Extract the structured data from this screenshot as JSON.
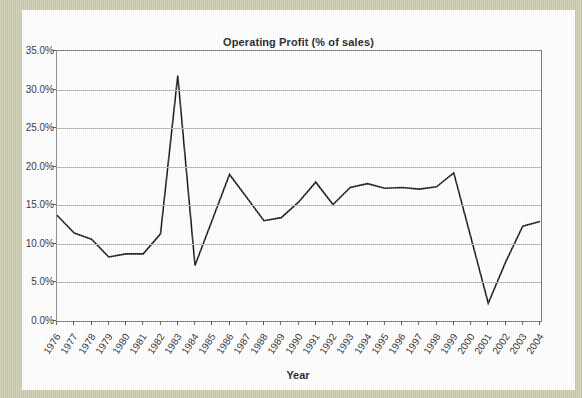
{
  "page": {
    "border_color": "#cbcbad",
    "paper_color": "#ffffff"
  },
  "chart": {
    "title": "Operating Profit (% of sales)",
    "x_axis_title": "Year",
    "line_color": "#1a1a1a",
    "grid_color": "#b4b4b4",
    "frame_color": "#7a7a7a"
  },
  "chart_data": {
    "type": "line",
    "title": "Operating Profit (% of sales)",
    "xlabel": "Year",
    "ylabel": "",
    "ylim": [
      0,
      35
    ],
    "ytick_values": [
      0,
      5,
      10,
      15,
      20,
      25,
      30,
      35
    ],
    "ytick_labels": [
      "0.0%",
      "5.0%",
      "10.0%",
      "15.0%",
      "20.0%",
      "25.0%",
      "30.0%",
      "35.0%"
    ],
    "grid": true,
    "legend": "none",
    "x": [
      1976,
      1977,
      1978,
      1979,
      1980,
      1981,
      1982,
      1983,
      1984,
      1985,
      1986,
      1987,
      1988,
      1989,
      1990,
      1991,
      1992,
      1993,
      1994,
      1995,
      1996,
      1997,
      1998,
      1999,
      2000,
      2001,
      2002,
      2003,
      2004
    ],
    "xtick_labels": [
      "1976",
      "1977",
      "1978",
      "1979",
      "1980",
      "1981",
      "1982",
      "1983",
      "1984",
      "1985",
      "1986",
      "1987",
      "1988",
      "1989",
      "1990",
      "1991",
      "1992",
      "1993",
      "1994",
      "1995",
      "1996",
      "1997",
      "1998",
      "1999",
      "2000",
      "2001",
      "2002",
      "2003",
      "2004"
    ],
    "series": [
      {
        "name": "Operating Profit (% of sales)",
        "values": [
          13.7,
          11.4,
          10.6,
          8.3,
          8.7,
          8.7,
          11.3,
          31.8,
          7.2,
          13.1,
          19.0,
          16.0,
          13.0,
          13.4,
          15.4,
          18.0,
          15.1,
          17.3,
          17.8,
          17.2,
          17.3,
          17.1,
          17.4,
          19.2,
          10.8,
          2.3,
          7.6,
          12.3,
          12.9
        ]
      }
    ]
  }
}
